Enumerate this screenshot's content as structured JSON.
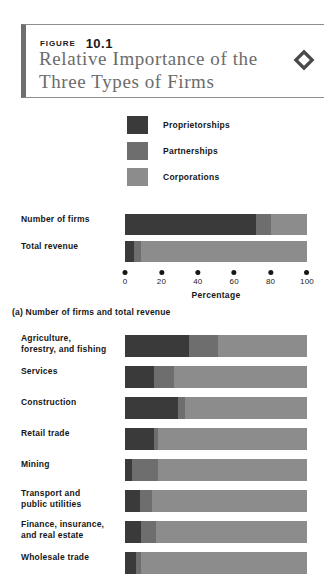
{
  "header": {
    "figure_word": "FIGURE",
    "figure_number": "10.1",
    "title_line1": "Relative Importance of the",
    "title_line2": "Three Types of Firms",
    "icon": "diamond-icon"
  },
  "colors": {
    "proprietorships": "#3a3a3a",
    "partnerships": "#6e6e6e",
    "corporations": "#8c8c8c",
    "border": "#8e8e8e",
    "accent_bar": "#6f6f6f",
    "title_text": "#6b6b6b"
  },
  "legend": {
    "items": [
      {
        "label": "Proprietorships",
        "color": "#3a3a3a"
      },
      {
        "label": "Partnerships",
        "color": "#6e6e6e"
      },
      {
        "label": "Corporations",
        "color": "#8c8c8c"
      }
    ]
  },
  "panel_a": {
    "caption": "(a) Number of firms and total revenue",
    "axis_title": "Percentage",
    "ticks": [
      "0",
      "20",
      "40",
      "60",
      "80",
      "100"
    ]
  },
  "chart_data": [
    {
      "type": "bar",
      "title": "(a) Number of firms and total revenue",
      "orientation": "horizontal",
      "stacked": true,
      "xlabel": "Percentage",
      "ylabel": "",
      "xlim": [
        0,
        100
      ],
      "grid": false,
      "legend_position": "top",
      "categories": [
        "Number of firms",
        "Total revenue"
      ],
      "series": [
        {
          "name": "Proprietorships",
          "color": "#3a3a3a",
          "values": [
            72,
            5
          ]
        },
        {
          "name": "Partnerships",
          "color": "#6e6e6e",
          "values": [
            8,
            4
          ]
        },
        {
          "name": "Corporations",
          "color": "#8c8c8c",
          "values": [
            20,
            91
          ]
        }
      ]
    },
    {
      "type": "bar",
      "title": "",
      "orientation": "horizontal",
      "stacked": true,
      "xlabel": "",
      "ylabel": "",
      "xlim": [
        0,
        100
      ],
      "grid": false,
      "legend_position": "top",
      "categories": [
        "Agriculture, forestry, and fishing",
        "Services",
        "Construction",
        "Retail trade",
        "Mining",
        "Transport and public utilities",
        "Finance, insurance, and real estate",
        "Wholesale trade"
      ],
      "series": [
        {
          "name": "Proprietorships",
          "color": "#3a3a3a",
          "values": [
            35,
            16,
            29,
            16,
            4,
            8,
            9,
            6
          ]
        },
        {
          "name": "Partnerships",
          "color": "#6e6e6e",
          "values": [
            16,
            11,
            4,
            2,
            14,
            7,
            8,
            3
          ]
        },
        {
          "name": "Corporations",
          "color": "#8c8c8c",
          "values": [
            49,
            73,
            67,
            82,
            82,
            85,
            83,
            91
          ]
        }
      ]
    }
  ],
  "panel_b": {
    "rows": [
      {
        "label_line1": "Agriculture,",
        "label_line2": "forestry, and fishing"
      },
      {
        "label_line1": "Services",
        "label_line2": ""
      },
      {
        "label_line1": "Construction",
        "label_line2": ""
      },
      {
        "label_line1": "Retail trade",
        "label_line2": ""
      },
      {
        "label_line1": "Mining",
        "label_line2": ""
      },
      {
        "label_line1": "Transport and",
        "label_line2": "public utilities"
      },
      {
        "label_line1": "Finance, insurance,",
        "label_line2": "and real estate"
      },
      {
        "label_line1": "Wholesale trade",
        "label_line2": ""
      }
    ]
  }
}
